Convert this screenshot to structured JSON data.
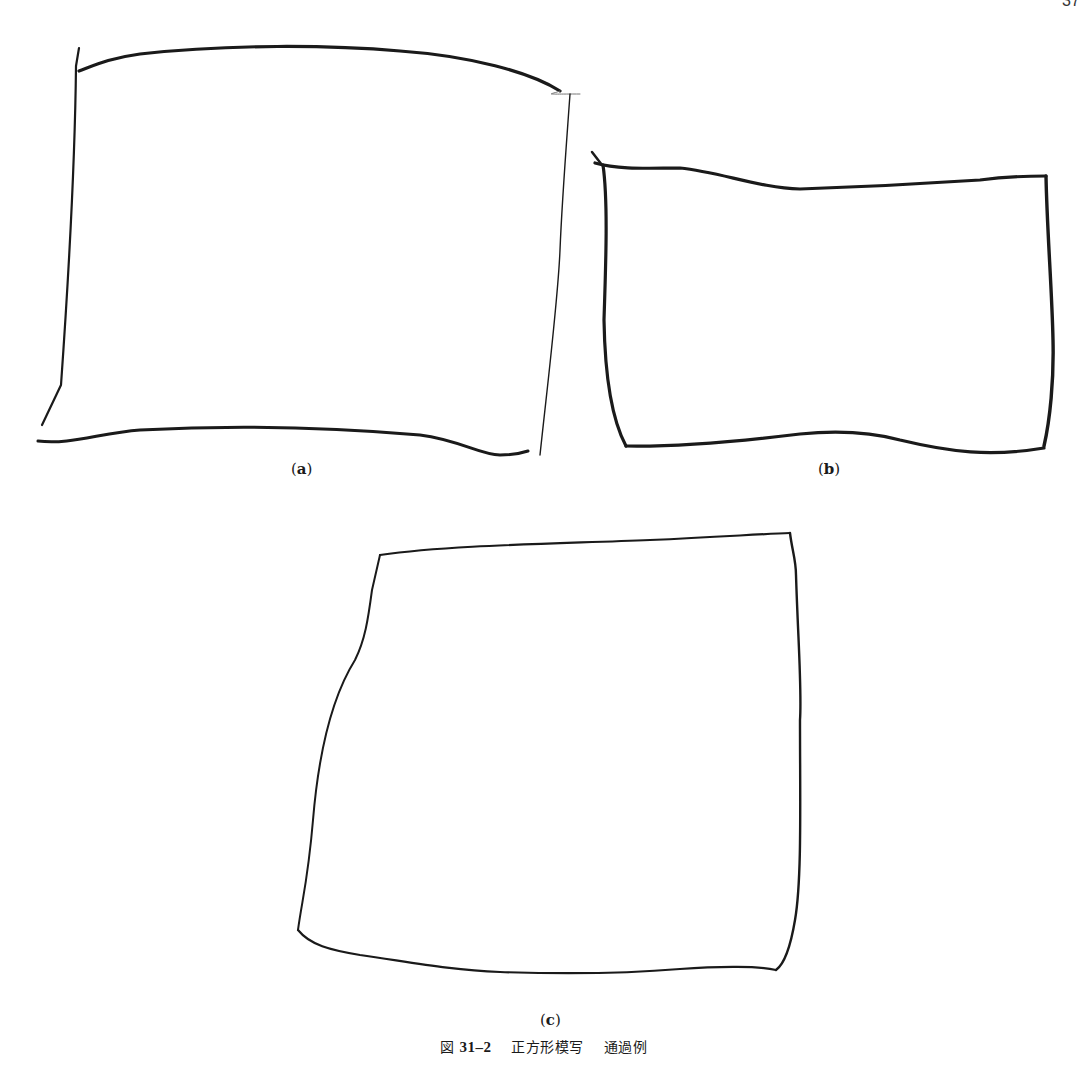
{
  "page": {
    "page_number": "37"
  },
  "figures": [
    {
      "id": "a",
      "label": "a"
    },
    {
      "id": "b",
      "label": "b"
    },
    {
      "id": "c",
      "label": "c"
    }
  ],
  "caption": {
    "prefix": "図",
    "number": "31–2",
    "title": "正方形模写",
    "subtitle": "通過例"
  },
  "colors": {
    "ink": "#1a1a1a",
    "background": "#ffffff"
  }
}
